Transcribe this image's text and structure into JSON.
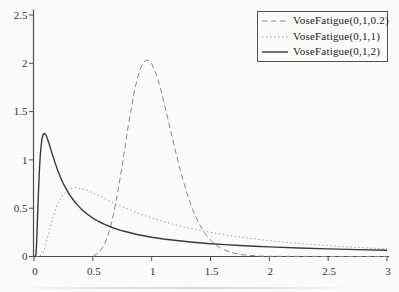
{
  "chart_data": {
    "type": "line",
    "title": "",
    "xlabel": "",
    "ylabel": "",
    "xlim": [
      0,
      3
    ],
    "ylim": [
      0,
      2.5
    ],
    "grid": false,
    "legend_position": "top-right",
    "axis_color": "#4c4c4c",
    "tick_label_color": "#333333",
    "x_ticks": [
      "0",
      "0.5",
      "1",
      "1.5",
      "2",
      "2.5",
      "3"
    ],
    "x_tick_values": [
      0,
      0.5,
      1,
      1.5,
      2,
      2.5,
      3
    ],
    "y_ticks": [
      "0",
      "0.5",
      "1",
      "1.5",
      "2",
      "2.5"
    ],
    "y_tick_values": [
      0,
      0.5,
      1,
      1.5,
      2,
      2.5
    ],
    "series": [
      {
        "name": "VoseFatigue(0,1,0.2)",
        "line_style": "dashed",
        "color": "#878787",
        "width": 1,
        "dash": "5.5 3.4",
        "points": [
          [
            0.5,
            0.001
          ],
          [
            0.55,
            0.038
          ],
          [
            0.6,
            0.122
          ],
          [
            0.65,
            0.298
          ],
          [
            0.7,
            0.583
          ],
          [
            0.75,
            0.949
          ],
          [
            0.8,
            1.343
          ],
          [
            0.85,
            1.693
          ],
          [
            0.875,
            1.826
          ],
          [
            0.9,
            1.932
          ],
          [
            0.925,
            2.0
          ],
          [
            0.95,
            2.033
          ],
          [
            0.975,
            2.029
          ],
          [
            1.0,
            1.995
          ],
          [
            1.025,
            1.932
          ],
          [
            1.05,
            1.845
          ],
          [
            1.075,
            1.739
          ],
          [
            1.1,
            1.619
          ],
          [
            1.15,
            1.362
          ],
          [
            1.2,
            1.102
          ],
          [
            1.25,
            0.86
          ],
          [
            1.3,
            0.652
          ],
          [
            1.35,
            0.48
          ],
          [
            1.4,
            0.346
          ],
          [
            1.45,
            0.245
          ],
          [
            1.5,
            0.169
          ],
          [
            1.55,
            0.115
          ],
          [
            1.6,
            0.077
          ],
          [
            1.675,
            0.041
          ],
          [
            1.75,
            0.021
          ],
          [
            1.9,
            0.005
          ],
          [
            2.0,
            0.002
          ],
          [
            2.25,
            0.001
          ],
          [
            2.5,
            0.0
          ],
          [
            2.75,
            0.0
          ],
          [
            3.0,
            0.0
          ]
        ]
      },
      {
        "name": "VoseFatigue(0,1,1)",
        "line_style": "dotted",
        "color": "#979797",
        "width": 1,
        "dash": "1.4 2.6",
        "points": [
          [
            0.02,
            0.0
          ],
          [
            0.05,
            0.002
          ],
          [
            0.08,
            0.048
          ],
          [
            0.1,
            0.121
          ],
          [
            0.12,
            0.213
          ],
          [
            0.15,
            0.355
          ],
          [
            0.175,
            0.458
          ],
          [
            0.2,
            0.539
          ],
          [
            0.25,
            0.648
          ],
          [
            0.3,
            0.697
          ],
          [
            0.35,
            0.712
          ],
          [
            0.4,
            0.703
          ],
          [
            0.45,
            0.685
          ],
          [
            0.5,
            0.659
          ],
          [
            0.6,
            0.601
          ],
          [
            0.675,
            0.557
          ],
          [
            0.75,
            0.515
          ],
          [
            0.875,
            0.453
          ],
          [
            1.0,
            0.399
          ],
          [
            1.125,
            0.353
          ],
          [
            1.25,
            0.313
          ],
          [
            1.375,
            0.279
          ],
          [
            1.5,
            0.25
          ],
          [
            1.625,
            0.224
          ],
          [
            1.75,
            0.202
          ],
          [
            1.875,
            0.182
          ],
          [
            2.0,
            0.165
          ],
          [
            2.125,
            0.149
          ],
          [
            2.25,
            0.136
          ],
          [
            2.375,
            0.123
          ],
          [
            2.5,
            0.113
          ],
          [
            2.625,
            0.103
          ],
          [
            2.75,
            0.094
          ],
          [
            2.875,
            0.086
          ],
          [
            3.0,
            0.079
          ]
        ]
      },
      {
        "name": "VoseFatigue(0,1,2)",
        "line_style": "solid",
        "color": "#3a3a3a",
        "width": 1.4,
        "dash": "",
        "points": [
          [
            0.0,
            0.0
          ],
          [
            0.01,
            0.0
          ],
          [
            0.015,
            0.017
          ],
          [
            0.02,
            0.089
          ],
          [
            0.025,
            0.223
          ],
          [
            0.03,
            0.391
          ],
          [
            0.035,
            0.566
          ],
          [
            0.04,
            0.728
          ],
          [
            0.045,
            0.867
          ],
          [
            0.05,
            0.984
          ],
          [
            0.055,
            1.073
          ],
          [
            0.06,
            1.139
          ],
          [
            0.065,
            1.192
          ],
          [
            0.07,
            1.229
          ],
          [
            0.08,
            1.268
          ],
          [
            0.09,
            1.273
          ],
          [
            0.1,
            1.261
          ],
          [
            0.11,
            1.234
          ],
          [
            0.12,
            1.198
          ],
          [
            0.135,
            1.141
          ],
          [
            0.15,
            1.081
          ],
          [
            0.175,
            0.984
          ],
          [
            0.2,
            0.897
          ],
          [
            0.225,
            0.82
          ],
          [
            0.25,
            0.753
          ],
          [
            0.3,
            0.643
          ],
          [
            0.35,
            0.559
          ],
          [
            0.4,
            0.493
          ],
          [
            0.45,
            0.44
          ],
          [
            0.5,
            0.397
          ],
          [
            0.55,
            0.362
          ],
          [
            0.6,
            0.332
          ],
          [
            0.675,
            0.295
          ],
          [
            0.75,
            0.266
          ],
          [
            0.875,
            0.228
          ],
          [
            1.0,
            0.199
          ],
          [
            1.1,
            0.181
          ],
          [
            1.25,
            0.16
          ],
          [
            1.375,
            0.145
          ],
          [
            1.5,
            0.133
          ],
          [
            1.625,
            0.123
          ],
          [
            1.75,
            0.114
          ],
          [
            1.875,
            0.106
          ],
          [
            2.0,
            0.099
          ],
          [
            2.25,
            0.088
          ],
          [
            2.5,
            0.079
          ],
          [
            2.75,
            0.071
          ],
          [
            3.0,
            0.065
          ]
        ]
      }
    ]
  }
}
